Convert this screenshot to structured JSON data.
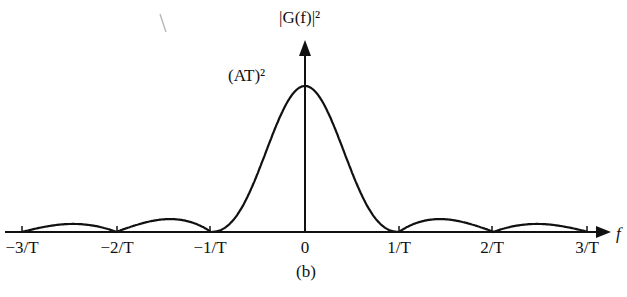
{
  "chart_data": {
    "type": "line",
    "title": "",
    "xlabel": "f",
    "ylabel": "|G(f)|²",
    "peak_label": "(AT)²",
    "caption": "(b)",
    "x_ticks": [
      "−3/T",
      "−2/T",
      "−1/T",
      "0",
      "1/T",
      "2/T",
      "3/T"
    ],
    "x_tick_values": [
      -3,
      -2,
      -1,
      0,
      1,
      2,
      3
    ],
    "function": "(AT)^2 * sinc^2(fT)",
    "series": [
      {
        "name": "|G(f)|²",
        "x": [
          -3,
          -2.5,
          -2,
          -1.5,
          -1,
          -0.5,
          0,
          0.5,
          1,
          1.5,
          2,
          2.5,
          3
        ],
        "values": [
          0,
          0.016,
          0,
          0.045,
          0,
          0.405,
          1,
          0.405,
          0,
          0.045,
          0,
          0.016,
          0
        ]
      }
    ],
    "xlim": [
      -3,
      3
    ],
    "ylim": [
      0,
      1
    ],
    "grid": false,
    "legend": "none"
  }
}
